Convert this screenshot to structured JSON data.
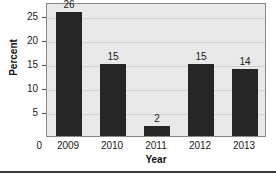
{
  "chart_data": {
    "type": "bar",
    "title": "",
    "xlabel": "Year",
    "ylabel": "Percent",
    "categories": [
      "2009",
      "2010",
      "2011",
      "2012",
      "2013"
    ],
    "values": [
      26,
      15,
      2,
      15,
      14
    ],
    "data_labels": [
      "26",
      "15",
      "2",
      "15",
      "14"
    ],
    "ylim": [
      0,
      28
    ],
    "yticks": [
      0,
      5,
      10,
      15,
      20,
      25
    ],
    "ytick_labels": [
      "0",
      "5",
      "10",
      "15",
      "20",
      "25"
    ],
    "grid": true,
    "legend": "none",
    "bar_color": "#262626",
    "plot_background": "#e9e9e9",
    "gridline_color": "#d2d2d2",
    "axis_color": "#8a8a8a"
  }
}
